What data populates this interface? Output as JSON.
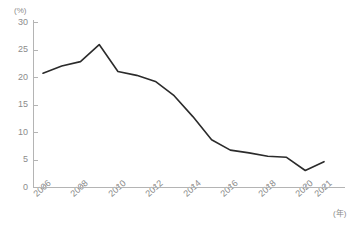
{
  "chart_data": {
    "type": "line",
    "title": "",
    "xlabel": "(年)",
    "ylabel": "(%)",
    "x": [
      2006,
      2007,
      2008,
      2009,
      2010,
      2011,
      2012,
      2013,
      2014,
      2015,
      2016,
      2017,
      2018,
      2019,
      2020,
      2021
    ],
    "values": [
      20.7,
      22.0,
      22.8,
      25.9,
      21.0,
      20.3,
      19.2,
      16.6,
      12.8,
      8.6,
      6.7,
      6.2,
      5.6,
      5.4,
      3.0,
      4.6
    ],
    "series": [
      {
        "name": "",
        "values": [
          20.7,
          22.0,
          22.8,
          25.9,
          21.0,
          20.3,
          19.2,
          16.6,
          12.8,
          8.6,
          6.7,
          6.2,
          5.6,
          5.4,
          3.0,
          4.6
        ]
      }
    ],
    "xlim": [
      2006,
      2021
    ],
    "ylim": [
      0,
      30
    ],
    "y_ticks": [
      0,
      5,
      10,
      15,
      20,
      25,
      30
    ],
    "x_ticks": [
      2006,
      2008,
      2010,
      2012,
      2014,
      2016,
      2018,
      2020,
      2021
    ],
    "grid": false,
    "legend": false,
    "line_color": "#2b2b2b",
    "axis_color": "#b4b4b4",
    "label_color": "#8c8c8c"
  },
  "axes": {
    "y_unit": "(%)",
    "x_unit": "(年)",
    "y_tick_labels": [
      "30",
      "25",
      "20",
      "15",
      "10",
      "5",
      "0"
    ],
    "x_tick_labels": [
      "2006",
      "2008",
      "2010",
      "2012",
      "2014",
      "2016",
      "2018",
      "2020",
      "2021"
    ]
  }
}
